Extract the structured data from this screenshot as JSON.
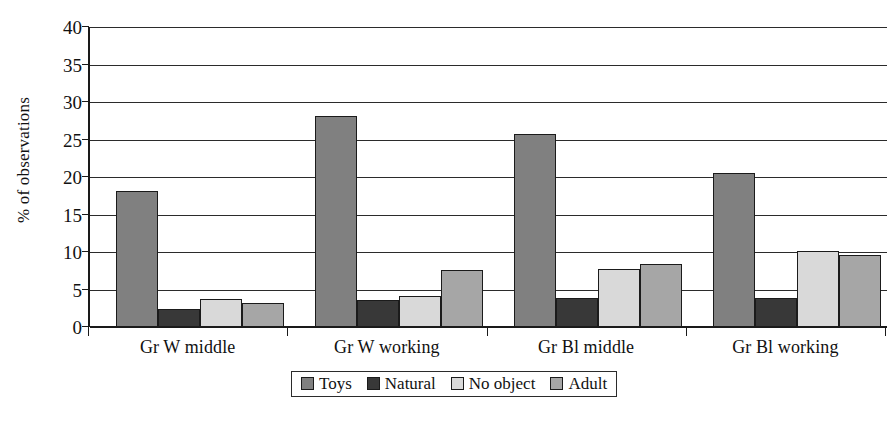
{
  "chart_data": {
    "type": "bar",
    "title": "",
    "subtitle": "",
    "xlabel": "",
    "ylabel": "% of observations",
    "ylim": [
      0,
      40
    ],
    "yticks": [
      0,
      5,
      10,
      15,
      20,
      25,
      30,
      35,
      40
    ],
    "ytick_labels": [
      "0",
      "5",
      "10",
      "15",
      "20",
      "25",
      "30",
      "35",
      "40"
    ],
    "grid": "horizontal",
    "legend_position": "bottom-center",
    "categories": [
      "Gr W middle",
      "Gr W working",
      "Gr Bl middle",
      "Gr Bl working"
    ],
    "series": [
      {
        "name": "Toys",
        "color": "#808080",
        "values": [
          18.2,
          28.1,
          25.8,
          20.5
        ]
      },
      {
        "name": "Natural",
        "color": "#383838",
        "values": [
          2.4,
          3.6,
          3.9,
          3.9
        ]
      },
      {
        "name": "No object",
        "color": "#d9d9d9",
        "values": [
          3.7,
          4.1,
          7.7,
          10.1
        ]
      },
      {
        "name": "Adult",
        "color": "#a6a6a6",
        "values": [
          3.2,
          7.6,
          8.4,
          9.6
        ]
      }
    ],
    "bar_outline_color": "#1b1b1b",
    "axis_color": "#1a1a1a",
    "gridline_color": "#2b2b2b",
    "background": "#ffffff"
  }
}
